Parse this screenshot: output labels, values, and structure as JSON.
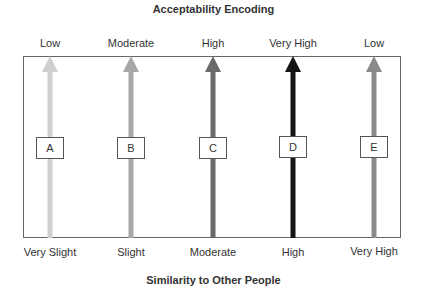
{
  "title": "Acceptability Encoding",
  "x_axis_title": "Similarity to Other People",
  "columns": [
    {
      "id": "A",
      "acceptability": "Low",
      "similarity": "Very Slight",
      "color": "#cfcfcf"
    },
    {
      "id": "B",
      "acceptability": "Moderate",
      "similarity": "Slight",
      "color": "#a8a8a8"
    },
    {
      "id": "C",
      "acceptability": "High",
      "similarity": "Moderate",
      "color": "#6a6a6a"
    },
    {
      "id": "D",
      "acceptability": "Very High",
      "similarity": "High",
      "color": "#151515"
    },
    {
      "id": "E",
      "acceptability": "Low",
      "similarity": "Very High",
      "color": "#8a8a8a"
    }
  ]
}
